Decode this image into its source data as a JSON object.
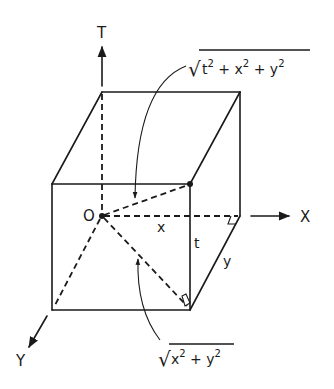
{
  "diagram": {
    "type": "3d-box-geometry",
    "colors": {
      "ink": "#1a1a1a",
      "background": "#ffffff"
    },
    "axes": {
      "t": "T",
      "x": "X",
      "y": "Y"
    },
    "origin_label": "O",
    "edge_labels": {
      "x": "x",
      "t": "t",
      "y": "y"
    },
    "formulas": {
      "space_diagonal": {
        "radical": "√",
        "terms": [
          {
            "base": "t",
            "exp": "2"
          },
          {
            "op": " + "
          },
          {
            "base": "x",
            "exp": "2"
          },
          {
            "op": " + "
          },
          {
            "base": "y",
            "exp": "2"
          }
        ],
        "text": "√(t² + x² + y²)"
      },
      "floor_diagonal": {
        "radical": "√",
        "terms": [
          {
            "base": "x",
            "exp": "2"
          },
          {
            "op": " + "
          },
          {
            "base": "y",
            "exp": "2"
          }
        ],
        "text": "√(x² + y²)"
      }
    }
  }
}
